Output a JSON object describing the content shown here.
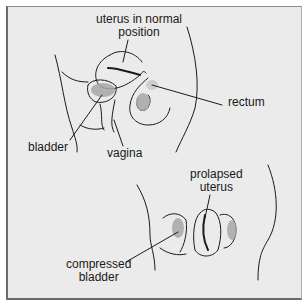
{
  "figure": {
    "top_panel": {
      "labels": {
        "uterus_normal_line1": "uterus in normal",
        "uterus_normal_line2": "position",
        "rectum": "rectum",
        "bladder": "bladder",
        "vagina": "vagina"
      }
    },
    "bottom_panel": {
      "labels": {
        "prolapsed_line1": "prolapsed",
        "prolapsed_line2": "uterus",
        "compressed_line1": "compressed",
        "compressed_line2": "bladder"
      }
    }
  },
  "colors": {
    "background": "#ebebeb",
    "border": "#6a6a6a",
    "ink": "#1a1a1a",
    "shading": "#a8a8a8"
  }
}
